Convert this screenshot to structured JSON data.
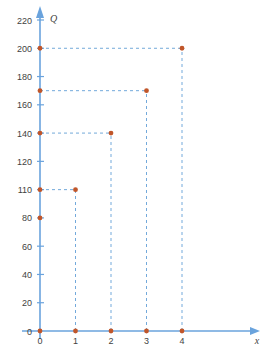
{
  "chart_data": {
    "type": "scatter",
    "title": "",
    "xlabel": "x",
    "ylabel": "Q",
    "grid": false,
    "legend": "none",
    "xlim": [
      0,
      4.6
    ],
    "ylim": [
      0,
      228
    ],
    "x_ticks": [
      "0",
      "1",
      "2",
      "3",
      "4"
    ],
    "x_tick_values": [
      0,
      1,
      2,
      3,
      4
    ],
    "y_ticks": [
      "0",
      "20",
      "40",
      "60",
      "80",
      "110",
      "120",
      "140",
      "160",
      "180",
      "200",
      "220"
    ],
    "y_tick_values": [
      0,
      20,
      40,
      60,
      80,
      110,
      120,
      140,
      160,
      180,
      200,
      220
    ],
    "x": [
      0,
      1,
      2,
      3,
      4
    ],
    "values": [
      0,
      110,
      140,
      170,
      200
    ],
    "points": [
      {
        "x": 0,
        "y": 0
      },
      {
        "x": 1,
        "y": 0
      },
      {
        "x": 2,
        "y": 0
      },
      {
        "x": 3,
        "y": 0
      },
      {
        "x": 4,
        "y": 0
      },
      {
        "x": 1,
        "y": 110
      },
      {
        "x": 2,
        "y": 140
      },
      {
        "x": 3,
        "y": 170
      },
      {
        "x": 4,
        "y": 200
      }
    ],
    "axis_markers_y": [
      80,
      110,
      140,
      170,
      200
    ],
    "guide_lines": [
      {
        "from": [
          0,
          110
        ],
        "to": [
          1,
          110
        ]
      },
      {
        "from": [
          0,
          140
        ],
        "to": [
          2,
          140
        ]
      },
      {
        "from": [
          0,
          170
        ],
        "to": [
          3,
          170
        ]
      },
      {
        "from": [
          0,
          200
        ],
        "to": [
          4,
          200
        ]
      },
      {
        "from": [
          1,
          0
        ],
        "to": [
          1,
          110
        ]
      },
      {
        "from": [
          2,
          0
        ],
        "to": [
          2,
          140
        ]
      },
      {
        "from": [
          3,
          0
        ],
        "to": [
          3,
          170
        ]
      },
      {
        "from": [
          4,
          0
        ],
        "to": [
          4,
          200
        ]
      }
    ],
    "colors": {
      "marker": "#c0562a",
      "axis": "#6aa3dd",
      "guide": "#5b9bd5",
      "tick_text": "#3f3f3f"
    }
  }
}
